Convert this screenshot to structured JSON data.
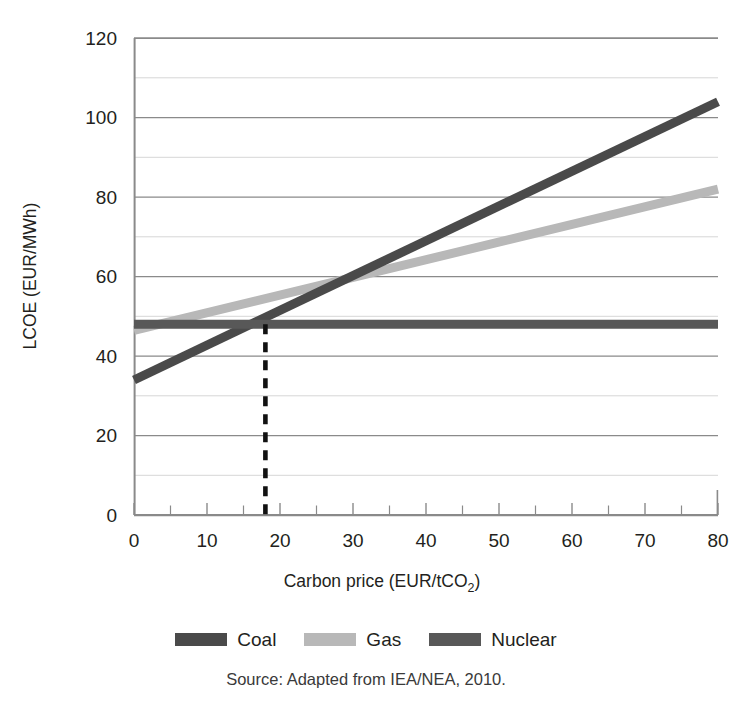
{
  "figure": {
    "cropped_title_fragment": "",
    "source_note": "Source: Adapted from IEA/NEA, 2010."
  },
  "legend": {
    "position": "bottom-center",
    "items": [
      {
        "label": "Coal",
        "color": "#4a4a4a",
        "swatch_name": "legend-swatch-coal"
      },
      {
        "label": "Gas",
        "color": "#b8b8b8",
        "swatch_name": "legend-swatch-gas"
      },
      {
        "label": "Nuclear",
        "color": "#585858",
        "swatch_name": "legend-swatch-nuclear"
      }
    ]
  },
  "axes": {
    "x": {
      "label": "Carbon price (EUR/tCO",
      "label_sub": "2",
      "label_close": ")",
      "ticks": [
        "0",
        "10",
        "20",
        "30",
        "40",
        "50",
        "60",
        "70",
        "80"
      ],
      "tick_values": [
        0,
        10,
        20,
        30,
        40,
        50,
        60,
        70,
        80
      ],
      "minor_tick_values": [
        5,
        15,
        25,
        35,
        45,
        55,
        65,
        75
      ],
      "min": 0,
      "max": 80
    },
    "y": {
      "label": "LCOE (EUR/MWh)",
      "ticks": [
        "0",
        "20",
        "40",
        "60",
        "80",
        "100",
        "120"
      ],
      "tick_values": [
        0,
        20,
        40,
        60,
        80,
        100,
        120
      ],
      "minor_tick_values": [
        10,
        30,
        50,
        70,
        90,
        110
      ],
      "min": 0,
      "max": 120
    }
  },
  "annotations": {
    "crossover_dashed_line": {
      "name": "coal-nuclear-crossover-marker",
      "x_value": 18,
      "y_top": 48,
      "y_bottom": 0,
      "color": "#111111",
      "style": "dashed"
    }
  },
  "chart_data": {
    "type": "line",
    "title": "",
    "xlabel": "Carbon price (EUR/tCO2)",
    "ylabel": "LCOE (EUR/MWh)",
    "xlim": [
      0,
      80
    ],
    "ylim": [
      0,
      120
    ],
    "grid": true,
    "grid_detail": "horizontal major lines every 20, lighter minor lines every 10",
    "legend_position": "bottom-center",
    "x": [
      0,
      80
    ],
    "series": [
      {
        "name": "Coal",
        "color": "#4a4a4a",
        "x": [
          0,
          80
        ],
        "values": [
          34,
          104
        ],
        "linewidth": 9
      },
      {
        "name": "Gas",
        "color": "#b8b8b8",
        "x": [
          0,
          80
        ],
        "values": [
          46.5,
          82
        ],
        "linewidth": 9
      },
      {
        "name": "Nuclear",
        "color": "#585858",
        "x": [
          0,
          80
        ],
        "values": [
          48,
          48
        ],
        "linewidth": 9
      }
    ],
    "annotations": [
      {
        "type": "vline-dashed",
        "x": 18,
        "y_range": [
          0,
          48
        ],
        "note": "Coal and Nuclear LCOE cross at a carbon price of about 18 EUR/tCO2"
      }
    ],
    "source": "Source: Adapted from IEA/NEA, 2010."
  }
}
